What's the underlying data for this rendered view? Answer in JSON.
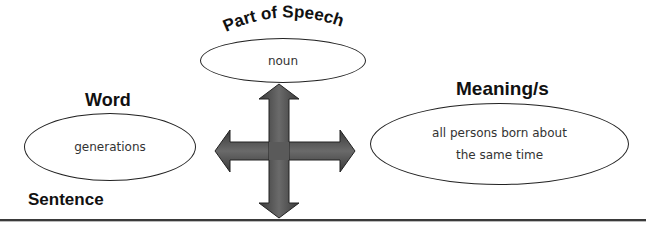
{
  "diagram": {
    "part_of_speech": {
      "title": "Part of Speech",
      "value": "noun"
    },
    "word": {
      "title": "Word",
      "value": "generations"
    },
    "meaning": {
      "title": "Meaning/s",
      "value_line1": "all persons born about",
      "value_line2": "the same time"
    },
    "sentence": {
      "title": "Sentence",
      "value": ""
    },
    "arrow": {
      "icon": "four-way-arrow-icon",
      "color": "#4a4a4a"
    }
  }
}
